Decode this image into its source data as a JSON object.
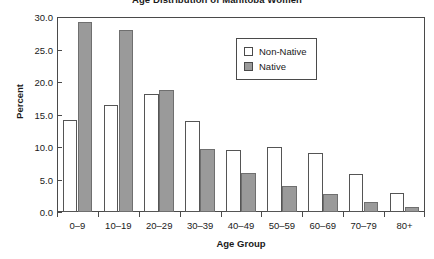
{
  "chart_data": {
    "type": "bar",
    "title": "Age Distribution of Manitoba Women",
    "xlabel": "Age Group",
    "ylabel": "Percent",
    "categories": [
      "0–9",
      "10–19",
      "20–29",
      "30–39",
      "40–49",
      "50–59",
      "60–69",
      "70–79",
      "80+"
    ],
    "series": [
      {
        "name": "Non-Native",
        "color": "#ffffff",
        "values": [
          14.2,
          16.5,
          18.2,
          14.0,
          9.6,
          10.0,
          9.1,
          5.8,
          3.0
        ]
      },
      {
        "name": "Native",
        "color": "#9a9a9a",
        "values": [
          29.3,
          28.0,
          18.8,
          9.7,
          6.0,
          4.0,
          2.7,
          1.5,
          0.7
        ]
      }
    ],
    "ylim": [
      0.0,
      30.0
    ],
    "ytick_labels": [
      "0.0",
      "5.0",
      "10.0",
      "15.0",
      "20.0",
      "25.0",
      "30.0"
    ],
    "ytick_values": [
      0.0,
      5.0,
      10.0,
      15.0,
      20.0,
      25.0,
      30.0
    ],
    "grid": false,
    "legend_position": "top-center",
    "legend_entries": [
      "Non-Native",
      "Native"
    ]
  }
}
